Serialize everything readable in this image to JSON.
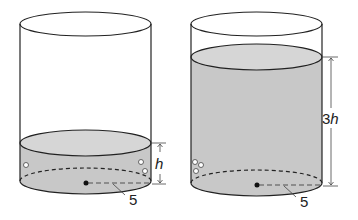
{
  "diagram": {
    "type": "two-cylinders-water-level",
    "colors": {
      "stroke": "#222222",
      "water": "#c8c8c8",
      "water_top": "#d6d6d6",
      "background": "#ffffff"
    },
    "left_cylinder": {
      "height_label_var": "h",
      "height_label_coef": "",
      "radius_label": "5"
    },
    "right_cylinder": {
      "height_label_var": "h",
      "height_label_coef": "3",
      "radius_label": "5"
    }
  }
}
